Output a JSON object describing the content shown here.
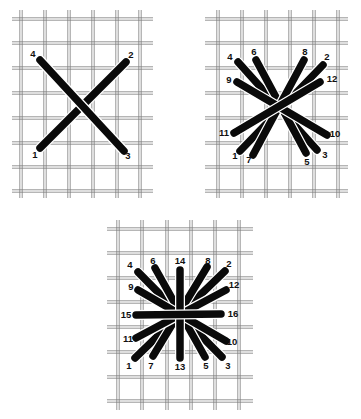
{
  "diagram": {
    "colors": {
      "background": "#ffffff",
      "canvas_thread": "#7a7a7a",
      "stitch": "#0a0a0a"
    },
    "panels": [
      {
        "id": "panel-1-cross",
        "grid": {
          "x0": 12,
          "x1": 153,
          "y0": 10,
          "y1": 198,
          "verticals": [
            21,
            45,
            69,
            93,
            117,
            140
          ],
          "horizontals": [
            19,
            43,
            68,
            93,
            118,
            143,
            167,
            191
          ]
        },
        "stitches": [
          {
            "from": "1",
            "to": "2",
            "a": [
              40,
              148
            ],
            "b": [
              126,
              62
            ]
          },
          {
            "from": "3",
            "to": "4",
            "a": [
              124,
              151
            ],
            "b": [
              40,
              60
            ]
          }
        ],
        "labels": [
          {
            "text": "4",
            "x": 33,
            "y": 54
          },
          {
            "text": "2",
            "x": 131,
            "y": 55
          },
          {
            "text": "1",
            "x": 35,
            "y": 155
          },
          {
            "text": "3",
            "x": 128,
            "y": 156
          }
        ]
      },
      {
        "id": "panel-2-double-cross",
        "grid": {
          "x0": 205,
          "x1": 348,
          "y0": 10,
          "y1": 198,
          "verticals": [
            218,
            242,
            266,
            290,
            314,
            338
          ],
          "horizontals": [
            19,
            43,
            68,
            93,
            118,
            143,
            167,
            191
          ]
        },
        "stitches": [
          {
            "from": "1",
            "to": "2",
            "a": [
              240,
              151
            ],
            "b": [
              323,
              65
            ]
          },
          {
            "from": "3",
            "to": "4",
            "a": [
              317,
              150
            ],
            "b": [
              238,
              62
            ]
          },
          {
            "from": "5",
            "to": "6",
            "a": [
              306,
              153
            ],
            "b": [
              256,
              60
            ]
          },
          {
            "from": "7",
            "to": "8",
            "a": [
              253,
              155
            ],
            "b": [
              304,
              60
            ]
          },
          {
            "from": "9",
            "to": "10",
            "a": [
              237,
              82
            ],
            "b": [
              327,
              135
            ]
          },
          {
            "from": "11",
            "to": "12",
            "a": [
              234,
              133
            ],
            "b": [
              320,
              82
            ]
          }
        ],
        "labels": [
          {
            "text": "4",
            "x": 230,
            "y": 57
          },
          {
            "text": "6",
            "x": 254,
            "y": 52
          },
          {
            "text": "8",
            "x": 305,
            "y": 52
          },
          {
            "text": "2",
            "x": 327,
            "y": 57
          },
          {
            "text": "9",
            "x": 229,
            "y": 80
          },
          {
            "text": "12",
            "x": 332,
            "y": 79
          },
          {
            "text": "11",
            "x": 224,
            "y": 133
          },
          {
            "text": "10",
            "x": 335,
            "y": 134
          },
          {
            "text": "1",
            "x": 235,
            "y": 156
          },
          {
            "text": "7",
            "x": 249,
            "y": 160
          },
          {
            "text": "5",
            "x": 307,
            "y": 162
          },
          {
            "text": "3",
            "x": 325,
            "y": 155
          }
        ]
      },
      {
        "id": "panel-3-star",
        "grid": {
          "x0": 107,
          "x1": 253,
          "y0": 220,
          "y1": 410,
          "verticals": [
            118,
            142,
            167,
            191,
            215,
            239
          ],
          "horizontals": [
            229,
            253,
            278,
            302,
            327,
            352,
            377,
            401
          ]
        },
        "stitches": [
          {
            "from": "1",
            "to": "2",
            "a": [
              135,
              358
            ],
            "b": [
              225,
              271
            ]
          },
          {
            "from": "3",
            "to": "4",
            "a": [
              222,
              357
            ],
            "b": [
              138,
              272
            ]
          },
          {
            "from": "5",
            "to": "6",
            "a": [
              205,
              357
            ],
            "b": [
              155,
              268
            ]
          },
          {
            "from": "7",
            "to": "8",
            "a": [
              153,
              356
            ],
            "b": [
              207,
              267
            ]
          },
          {
            "from": "9",
            "to": "10",
            "a": [
              138,
              290
            ],
            "b": [
              226,
              341
            ]
          },
          {
            "from": "11",
            "to": "12",
            "a": [
              136,
              338
            ],
            "b": [
              226,
              290
            ]
          },
          {
            "from": "13",
            "to": "14",
            "a": [
              180,
              358
            ],
            "b": [
              180,
              270
            ]
          },
          {
            "from": "15",
            "to": "16",
            "a": [
              136,
              315
            ],
            "b": [
              221,
              314
            ]
          }
        ],
        "labels": [
          {
            "text": "4",
            "x": 130,
            "y": 265
          },
          {
            "text": "6",
            "x": 153,
            "y": 261
          },
          {
            "text": "14",
            "x": 180,
            "y": 261
          },
          {
            "text": "8",
            "x": 208,
            "y": 261
          },
          {
            "text": "2",
            "x": 229,
            "y": 264
          },
          {
            "text": "9",
            "x": 131,
            "y": 287
          },
          {
            "text": "12",
            "x": 234,
            "y": 285
          },
          {
            "text": "15",
            "x": 126,
            "y": 315
          },
          {
            "text": "16",
            "x": 233,
            "y": 314
          },
          {
            "text": "11",
            "x": 128,
            "y": 339
          },
          {
            "text": "10",
            "x": 232,
            "y": 342
          },
          {
            "text": "1",
            "x": 129,
            "y": 366
          },
          {
            "text": "7",
            "x": 151,
            "y": 366
          },
          {
            "text": "13",
            "x": 180,
            "y": 367
          },
          {
            "text": "5",
            "x": 206,
            "y": 366
          },
          {
            "text": "3",
            "x": 228,
            "y": 366
          }
        ]
      }
    ]
  }
}
